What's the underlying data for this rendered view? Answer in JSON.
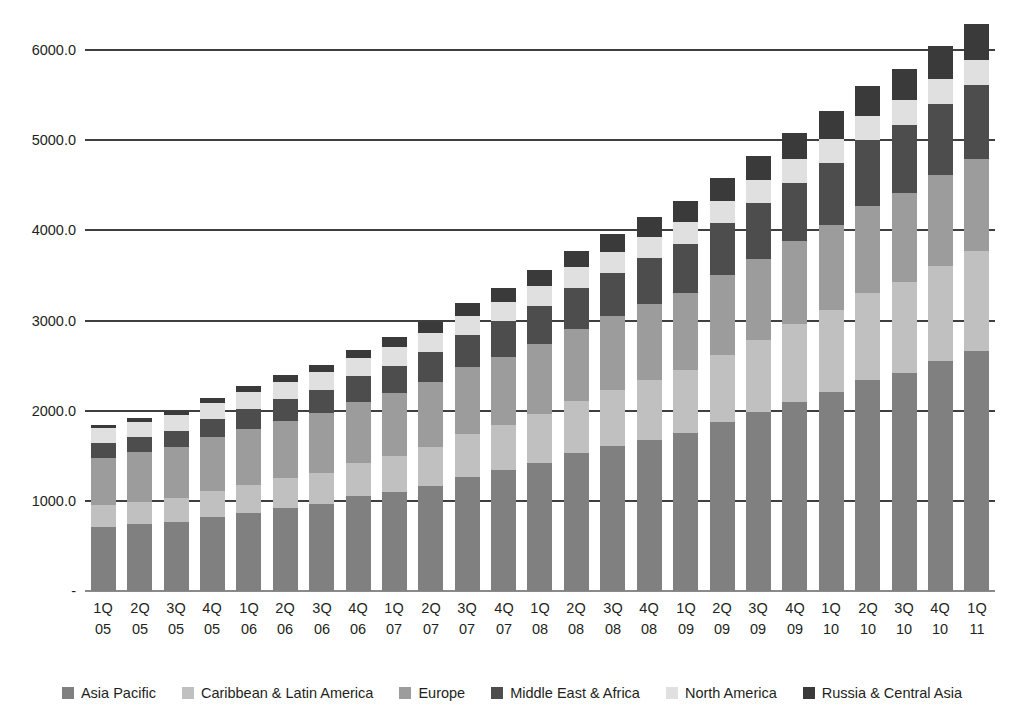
{
  "chart_data": {
    "type": "bar",
    "stacked": true,
    "title": "",
    "subtitle": "",
    "xlabel": "",
    "ylabel": "",
    "ylim": [
      0,
      6000
    ],
    "ytick_labels": [
      "-",
      "1000.0",
      "2000.0",
      "3000.0",
      "4000.0",
      "5000.0",
      "6000.0"
    ],
    "ytick_values": [
      0,
      1000,
      2000,
      3000,
      4000,
      5000,
      6000
    ],
    "grid": "horizontal",
    "legend_position": "bottom",
    "categories": [
      "1Q 05",
      "2Q 05",
      "3Q 05",
      "4Q 05",
      "1Q 06",
      "2Q 06",
      "3Q 06",
      "4Q 06",
      "1Q 07",
      "2Q 07",
      "3Q 07",
      "4Q 07",
      "1Q 08",
      "2Q 08",
      "3Q 08",
      "4Q 08",
      "1Q 09",
      "2Q 09",
      "3Q 09",
      "4Q 09",
      "1Q 10",
      "2Q 10",
      "3Q 10",
      "4Q 10",
      "1Q 11"
    ],
    "category_lines": [
      [
        "1Q",
        "05"
      ],
      [
        "2Q",
        "05"
      ],
      [
        "3Q",
        "05"
      ],
      [
        "4Q",
        "05"
      ],
      [
        "1Q",
        "06"
      ],
      [
        "2Q",
        "06"
      ],
      [
        "3Q",
        "06"
      ],
      [
        "4Q",
        "06"
      ],
      [
        "1Q",
        "07"
      ],
      [
        "2Q",
        "07"
      ],
      [
        "3Q",
        "07"
      ],
      [
        "4Q",
        "07"
      ],
      [
        "1Q",
        "08"
      ],
      [
        "2Q",
        "08"
      ],
      [
        "3Q",
        "08"
      ],
      [
        "4Q",
        "08"
      ],
      [
        "1Q",
        "09"
      ],
      [
        "2Q",
        "09"
      ],
      [
        "3Q",
        "09"
      ],
      [
        "4Q",
        "09"
      ],
      [
        "1Q",
        "10"
      ],
      [
        "2Q",
        "10"
      ],
      [
        "3Q",
        "10"
      ],
      [
        "4Q",
        "10"
      ],
      [
        "1Q",
        "11"
      ]
    ],
    "series": [
      {
        "name": "Asia Pacific",
        "color": "#808080",
        "values": [
          710,
          740,
          760,
          820,
          870,
          920,
          960,
          1050,
          1100,
          1170,
          1270,
          1340,
          1420,
          1530,
          1610,
          1680,
          1750,
          1870,
          1980,
          2100,
          2210,
          2340,
          2420,
          2550,
          2660
        ]
      },
      {
        "name": "Caribbean & Latin America",
        "color": "#c0c0c0",
        "values": [
          240,
          250,
          270,
          290,
          310,
          330,
          350,
          370,
          400,
          430,
          470,
          500,
          540,
          580,
          620,
          660,
          700,
          750,
          800,
          860,
          910,
          970,
          1010,
          1060,
          1110
        ]
      },
      {
        "name": "Europe",
        "color": "#9c9c9c",
        "values": [
          530,
          550,
          570,
          600,
          620,
          640,
          660,
          680,
          700,
          720,
          740,
          760,
          780,
          800,
          820,
          840,
          860,
          880,
          900,
          920,
          940,
          960,
          980,
          1000,
          1020
        ]
      },
      {
        "name": "Middle East & Africa",
        "color": "#4d4d4d",
        "values": [
          160,
          170,
          180,
          200,
          220,
          240,
          260,
          280,
          300,
          330,
          360,
          390,
          420,
          450,
          480,
          510,
          540,
          580,
          620,
          650,
          690,
          730,
          760,
          790,
          820
        ]
      },
      {
        "name": "North America",
        "color": "#e0e0e0",
        "values": [
          165,
          170,
          175,
          180,
          185,
          190,
          195,
          200,
          205,
          210,
          215,
          220,
          225,
          230,
          235,
          240,
          245,
          250,
          255,
          260,
          265,
          270,
          275,
          280,
          285
        ]
      },
      {
        "name": "Russia & Central Asia",
        "color": "#3a3a3a",
        "values": [
          35,
          40,
          45,
          55,
          65,
          75,
          85,
          95,
          110,
          125,
          140,
          155,
          170,
          185,
          200,
          215,
          230,
          250,
          270,
          290,
          310,
          330,
          350,
          370,
          390
        ]
      }
    ],
    "totals": [
      1840,
      1920,
      2000,
      2145,
      2270,
      2395,
      2510,
      2675,
      2815,
      2985,
      3195,
      3365,
      3555,
      3775,
      3965,
      4145,
      4325,
      4580,
      4825,
      5080,
      5325,
      5600,
      5795,
      6050,
      6285
    ]
  },
  "legend": {
    "items": [
      {
        "label": "Asia Pacific",
        "color": "#808080"
      },
      {
        "label": "Caribbean & Latin America",
        "color": "#c0c0c0"
      },
      {
        "label": "Europe",
        "color": "#9c9c9c"
      },
      {
        "label": "Middle East & Africa",
        "color": "#4d4d4d"
      },
      {
        "label": "North America",
        "color": "#e0e0e0"
      },
      {
        "label": "Russia & Central Asia",
        "color": "#3a3a3a"
      }
    ]
  },
  "axis": {
    "zero_label": "-"
  }
}
